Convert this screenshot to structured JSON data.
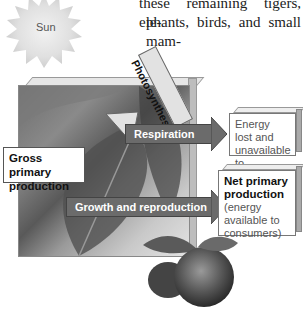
{
  "body_text": {
    "line1": "these remaining tigers, ele-",
    "line2": "phants, birds, and small mam-"
  },
  "diagram": {
    "sun_label": "Sun",
    "photosynthesis_label": "Photosynthesis",
    "gross_primary_production": "Gross primary production",
    "respiration_label": "Respiration",
    "growth_label": "Growth and reproduction",
    "energy_lost_box": "Energy lost and unavailable to consumers",
    "net_box_title": "Net primary production",
    "net_box_sub": "(energy available to consumers)"
  },
  "colors": {
    "arrow_fill": "#6b6b6b",
    "box_border": "#777777",
    "sun": "#d9d9d9"
  }
}
